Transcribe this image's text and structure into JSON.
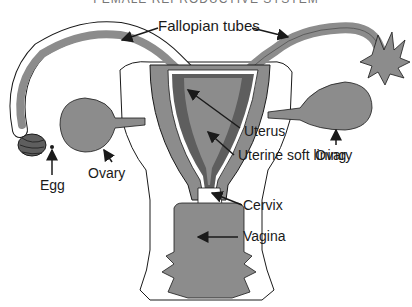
{
  "title": "FEMALE REPRODUCTIVE SYSTEM",
  "labels": {
    "fallopian_tubes": "Fallopian tubes",
    "ovary_left": "Ovary",
    "ovary_right": "Ovary",
    "egg": "Egg",
    "uterus": "Uterus",
    "uterine_lining": "Uterine soft lining",
    "cervix": "Cervix",
    "vagina": "Vagina"
  },
  "colors": {
    "tissue": "#8c8c8c",
    "lining": "#5e5e5e",
    "outline": "#1a1a1a",
    "background": "#ffffff"
  }
}
